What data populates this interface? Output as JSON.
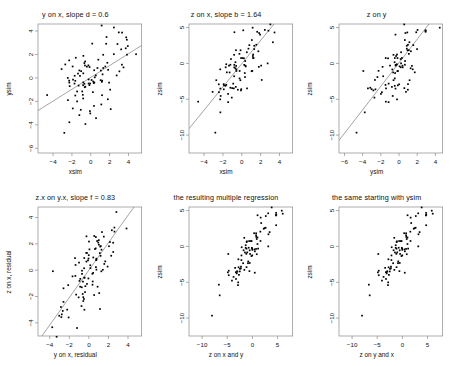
{
  "figure": {
    "type": "scatter-matrix",
    "background": "#ffffff",
    "point_color": "#000000",
    "line_color": "#666666",
    "frame_color": "#8a8a8a",
    "rows": 2,
    "cols": 3
  },
  "chart_data": [
    {
      "id": "panel-1",
      "type": "scatter",
      "title": "y on x, slope d = 0.6",
      "xlabel": "xsim",
      "ylabel": "ysim",
      "xlim": [
        -5.6,
        5.4
      ],
      "ylim": [
        -6.4,
        4.6
      ],
      "xticks": [
        -4,
        -2,
        0,
        2,
        4
      ],
      "yticks": [
        4,
        2,
        0,
        -2,
        -4,
        -6
      ],
      "grid": false,
      "has_fit_line": true,
      "fit_slope": 0.6,
      "fit_intercept": 0.0,
      "n_points": 100,
      "x": [
        -4.9,
        -4.4,
        -4.1,
        -3.8,
        -3.6,
        -3.5,
        -3.3,
        -3.2,
        -3.1,
        -3.0,
        -2.9,
        -2.85,
        -2.8,
        -2.75,
        -2.7,
        -2.6,
        -2.55,
        -2.5,
        -2.45,
        -2.4,
        -2.35,
        -2.3,
        -2.25,
        -2.2,
        -2.15,
        -2.1,
        -2.05,
        -2.0,
        -1.95,
        -1.9,
        -1.85,
        -1.8,
        -1.75,
        -1.7,
        -1.65,
        -1.6,
        -1.55,
        -1.5,
        -1.45,
        -1.4,
        -1.35,
        -1.3,
        -1.25,
        -1.2,
        -1.15,
        -1.1,
        -1.05,
        -1.0,
        -0.95,
        -0.9,
        -0.85,
        -0.8,
        -0.75,
        -0.7,
        -0.65,
        -0.6,
        -0.55,
        -0.5,
        -0.45,
        -0.4,
        -0.35,
        -0.3,
        -0.25,
        -0.2,
        -0.15,
        -0.1,
        -0.05,
        0.0,
        0.1,
        0.2,
        0.3,
        0.4,
        0.5,
        0.6,
        0.7,
        0.8,
        0.9,
        1.0,
        1.1,
        1.2,
        1.3,
        1.4,
        1.5,
        1.6,
        1.7,
        1.8,
        1.9,
        2.0,
        2.1,
        2.2,
        2.4,
        2.6,
        2.8,
        3.0,
        3.2,
        3.4,
        3.6,
        3.9,
        4.2,
        4.6,
        5.0
      ],
      "y": [
        -6.2,
        -1.9,
        0.3,
        -0.6,
        -2.2,
        1.0,
        -2.6,
        -3.5,
        -4.4,
        -4.1,
        -3.2,
        -4.7,
        -0.8,
        -5.1,
        0.9,
        -1.2,
        -3.6,
        -5.4,
        -4.9,
        -1.6,
        -0.5,
        -2.8,
        -5.6,
        0.6,
        -3.1,
        -2.0,
        -4.3,
        -0.9,
        1.4,
        0.2,
        -1.5,
        -3.9,
        -2.4,
        1.1,
        -0.3,
        -1.1,
        -2.2,
        0.5,
        -4.5,
        -0.7,
        -2.9,
        1.8,
        -0.1,
        0.8,
        -1.8,
        -3.3,
        0.3,
        -0.4,
        1.2,
        -1.0,
        0.6,
        -2.1,
        0.1,
        -0.6,
        2.8,
        -1.4,
        0.4,
        -0.2,
        1.6,
        -1.7,
        0.0,
        0.9,
        -0.9,
        0.2,
        -1.3,
        0.7,
        -0.5,
        0.35,
        1.3,
        -0.8,
        0.5,
        2.0,
        -1.1,
        0.1,
        1.5,
        -0.4,
        0.8,
        -1.6,
        0.6,
        2.2,
        -0.3,
        1.0,
        3.4,
        0.2,
        -0.7,
        1.9,
        2.6,
        0.4,
        1.1,
        3.2,
        2.9,
        1.5,
        3.5,
        2.1,
        0.6,
        3.3,
        1.8,
        3.6,
        1.0,
        4.1,
        2.4
      ]
    },
    {
      "id": "panel-2",
      "type": "scatter",
      "title": "z on x, slope b = 1.64",
      "xlabel": "xsim",
      "ylabel": "zsim",
      "xlim": [
        -5.6,
        5.4
      ],
      "ylim": [
        -12.5,
        5.5
      ],
      "xticks": [
        -4,
        -2,
        0,
        2,
        4
      ],
      "yticks": [
        5,
        0,
        -5,
        -10
      ],
      "grid": false,
      "has_fit_line": true,
      "fit_slope": 1.64,
      "fit_intercept": 0.0,
      "n_points": 100
    },
    {
      "id": "panel-3",
      "type": "scatter",
      "title": "z on y",
      "xlabel": "ysim",
      "ylabel": "zsim",
      "xlim": [
        -6.6,
        4.8
      ],
      "ylim": [
        -12.5,
        5.5
      ],
      "xticks": [
        -6,
        -4,
        -2,
        0,
        2,
        4
      ],
      "yticks": [
        5,
        0,
        -5,
        -10
      ],
      "grid": false,
      "has_fit_line": true,
      "n_points": 100
    },
    {
      "id": "panel-4",
      "type": "scatter",
      "title": "z.x on y.x, slope f = 0.83",
      "xlabel": "y on x, residual",
      "ylabel": "z on x, residual",
      "xlim": [
        -5.2,
        5.4
      ],
      "ylim": [
        -5.0,
        4.8
      ],
      "xticks": [
        -4,
        -2,
        0,
        2,
        4
      ],
      "yticks": [
        4,
        2,
        0,
        -2,
        -4
      ],
      "grid": false,
      "has_fit_line": true,
      "fit_slope": 0.83,
      "fit_intercept": 0.0,
      "n_points": 100
    },
    {
      "id": "panel-5",
      "type": "scatter",
      "title": "the resulting multiple regression",
      "xlabel": "z on x and y",
      "ylabel": "zsim",
      "xlim": [
        -12.6,
        8.0
      ],
      "ylim": [
        -12.5,
        5.5
      ],
      "xticks": [
        -10,
        -5,
        0,
        5
      ],
      "yticks": [
        5,
        0,
        -5,
        -10
      ],
      "grid": false,
      "has_fit_line": false,
      "n_points": 100
    },
    {
      "id": "panel-6",
      "type": "scatter",
      "title": "the same starting with ysim",
      "xlabel": "z on y and x",
      "ylabel": "zsim",
      "xlim": [
        -12.6,
        8.0
      ],
      "ylim": [
        -12.5,
        5.5
      ],
      "xticks": [
        -10,
        -5,
        0,
        5
      ],
      "yticks": [
        5,
        0,
        -5,
        -10
      ],
      "grid": false,
      "has_fit_line": false,
      "n_points": 100
    }
  ]
}
